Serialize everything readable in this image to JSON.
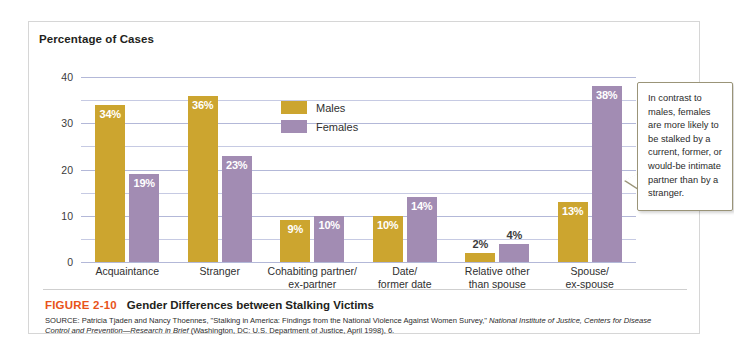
{
  "figure": {
    "number": "FIGURE 2-10",
    "title": "Gender Differences between Stalking Victims",
    "source_line1": "SOURCE: Patricia Tjaden and Nancy Thoennes, \"Stalking in America: Findings from the National Violence Against Women Survey,\"",
    "source_line2_italic": "National Institute of Justice, Centers for Disease Control and Prevention—Research in Brief",
    "source_line2_rest": " (Washington, DC: U.S. Department of",
    "source_line3": "Justice, April 1998), 6."
  },
  "callout": {
    "text": "In contrast to males, females are more likely to be stalked by a current, former, or would-be intimate partner than by a stranger."
  },
  "colors": {
    "males": "#cca52f",
    "females": "#a28cb3",
    "gridline": "#b3b8d8",
    "figure_number": "#e8531a",
    "frame_border": "#d6d6d6"
  },
  "chart_data": {
    "type": "bar",
    "title": "Percentage of Cases",
    "xlabel": "",
    "ylabel": "Percentage of Cases",
    "ylim": [
      0,
      40
    ],
    "yticks": [
      0,
      10,
      20,
      30,
      40
    ],
    "ytick_labels": [
      "0",
      "10",
      "20",
      "30",
      "40"
    ],
    "minor_gridlines": [
      5,
      15,
      25,
      35
    ],
    "grid": true,
    "legend_position": "inside-top-center",
    "categories": [
      "Acquaintance",
      "Stranger",
      "Cohabiting partner/ ex-partner",
      "Date/ former date",
      "Relative other than spouse",
      "Spouse/ ex-spouse"
    ],
    "category_lines": [
      [
        "Acquaintance"
      ],
      [
        "Stranger"
      ],
      [
        "Cohabiting partner/",
        "ex-partner"
      ],
      [
        "Date/",
        "former date"
      ],
      [
        "Relative other",
        "than spouse"
      ],
      [
        "Spouse/",
        "ex-spouse"
      ]
    ],
    "series": [
      {
        "name": "Males",
        "color": "#cca52f",
        "values": [
          34,
          36,
          9,
          10,
          2,
          13
        ],
        "labels": [
          "34%",
          "36%",
          "9%",
          "10%",
          "2%",
          "13%"
        ]
      },
      {
        "name": "Females",
        "color": "#a28cb3",
        "values": [
          19,
          23,
          10,
          14,
          4,
          38
        ],
        "labels": [
          "19%",
          "23%",
          "10%",
          "14%",
          "4%",
          "38%"
        ]
      }
    ]
  }
}
